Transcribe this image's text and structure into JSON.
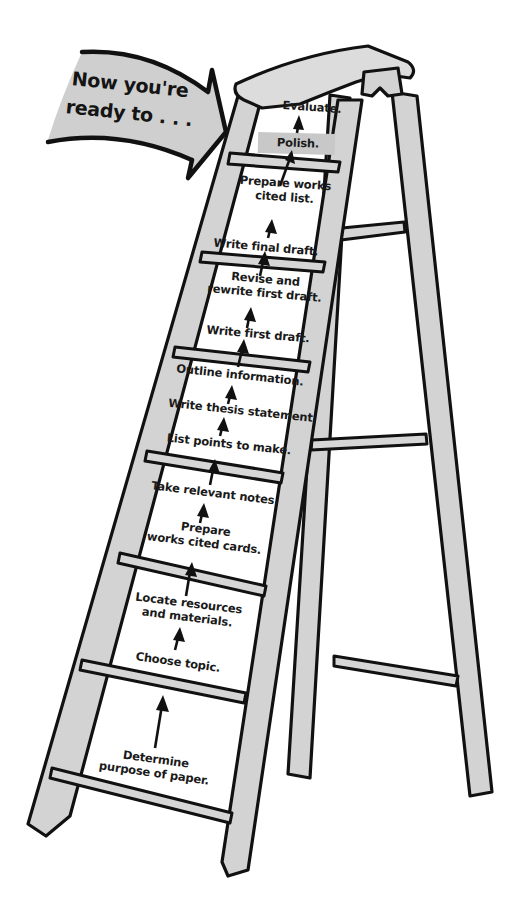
{
  "banner": {
    "line1": "Now you're",
    "line2": "ready to . . .",
    "fill_color": "#cfcfcf"
  },
  "colors": {
    "wood": "#d3d3d3",
    "outline": "#111111",
    "highlight": "#c8c8c8",
    "background": "#ffffff"
  },
  "steps": [
    {
      "order": 1,
      "lines": [
        "Determine",
        "purpose of paper."
      ]
    },
    {
      "order": 2,
      "lines": [
        "Choose topic."
      ]
    },
    {
      "order": 3,
      "lines": [
        "Locate resources",
        "and materials."
      ]
    },
    {
      "order": 4,
      "lines": [
        "Prepare",
        "works cited cards."
      ]
    },
    {
      "order": 5,
      "lines": [
        "Take relevant notes."
      ]
    },
    {
      "order": 6,
      "lines": [
        "List points to make."
      ]
    },
    {
      "order": 7,
      "lines": [
        "Write thesis statement."
      ]
    },
    {
      "order": 8,
      "lines": [
        "Outline information."
      ]
    },
    {
      "order": 9,
      "lines": [
        "Write first draft."
      ]
    },
    {
      "order": 10,
      "lines": [
        "Revise and",
        "rewrite first draft."
      ]
    },
    {
      "order": 11,
      "lines": [
        "Write final draft."
      ]
    },
    {
      "order": 12,
      "lines": [
        "Prepare works",
        "cited list."
      ]
    },
    {
      "order": 13,
      "lines": [
        "Polish."
      ],
      "highlighted": true
    },
    {
      "order": 14,
      "lines": [
        "Evaluate."
      ]
    }
  ]
}
